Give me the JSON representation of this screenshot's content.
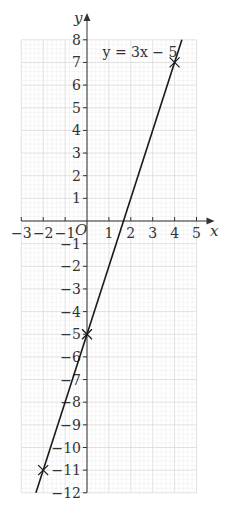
{
  "chart_data": {
    "type": "line",
    "title": "",
    "equation_label": "y = 3x − 5",
    "xlabel": "x",
    "ylabel": "y",
    "origin_label": "O",
    "xlim": [
      -3,
      5
    ],
    "ylim": [
      -12,
      8
    ],
    "x_ticks": [
      -3,
      -2,
      -1,
      1,
      2,
      3,
      4,
      5
    ],
    "x_tick_labels": [
      "−3",
      "−2",
      "−1",
      "1",
      "2",
      "3",
      "4",
      "5"
    ],
    "y_ticks": [
      8,
      7,
      6,
      5,
      4,
      3,
      2,
      1,
      -1,
      -2,
      -3,
      -4,
      -5,
      -6,
      -7,
      -8,
      -9,
      -10,
      -11,
      -12
    ],
    "y_tick_labels": [
      "8",
      "7",
      "6",
      "5",
      "4",
      "3",
      "2",
      "1",
      "−1",
      "−2",
      "−3",
      "−4",
      "−5",
      "−6",
      "−7",
      "−8",
      "−9",
      "−10",
      "−11",
      "−12"
    ],
    "grid": true,
    "minor_grid_per_unit": 5,
    "series": [
      {
        "name": "y = 3x − 5",
        "slope": 3,
        "intercept": -5,
        "x": [
          -2.333,
          4.333
        ],
        "y": [
          -12,
          8
        ]
      }
    ],
    "marked_points": [
      {
        "x": -2,
        "y": -11
      },
      {
        "x": 0,
        "y": -5
      },
      {
        "x": 4,
        "y": 7
      }
    ],
    "colors": {
      "line": "#1a1a1a",
      "axis": "#333333",
      "grid_minor": "#ececec",
      "grid_major": "#d9d9d9"
    }
  }
}
